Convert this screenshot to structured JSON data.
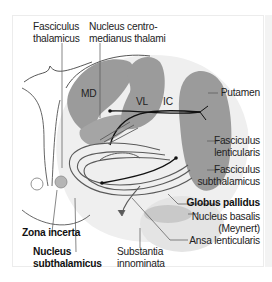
{
  "diagram": {
    "type": "anatomical-section",
    "region_labels": {
      "md": "MD",
      "vl": "VL",
      "ic": "IC"
    },
    "labels": {
      "fasciculus_thalamicus": [
        "Fasciculus",
        "thalamicus"
      ],
      "nucleus_centromedianus": [
        "Nucleus centro-",
        "medianus thalami"
      ],
      "putamen": "Putamen",
      "fasciculus_lenticularis": [
        "Fasciculus",
        "lenticularis"
      ],
      "fasciculus_subthalamicus": [
        "Fasciculus",
        "subthalamicus"
      ],
      "globus_pallidus": "Globus pallidus",
      "nucleus_basalis": [
        "Nucleus basalis",
        "(Meynert)"
      ],
      "ansa_lenticularis": "Ansa lenticularis",
      "zona_incerta": "Zona incerta",
      "nucleus_subthalamicus": [
        "Nucleus",
        "subthalamicus"
      ],
      "substantia_innominata": [
        "Substantia",
        "innominata"
      ]
    },
    "bold_labels": [
      "Globus pallidus",
      "Zona incerta",
      "Nucleus subthalamicus"
    ],
    "colors": {
      "nucleus_fill": "#9b9b9b",
      "light_region": "#ececec",
      "fiber_dark": "#111111",
      "fiber_gray": "#5a5a5a",
      "leader_line": "#555555",
      "text": "#222222"
    }
  }
}
